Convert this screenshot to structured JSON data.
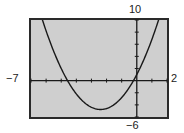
{
  "chart_data": {
    "type": "line",
    "title": "",
    "xlabel": "",
    "ylabel": "",
    "xlim": [
      -7,
      2
    ],
    "ylim": [
      -6,
      10
    ],
    "x_tick_step": 1,
    "y_tick_step": 2,
    "grid": false,
    "legend": null,
    "window_labels": {
      "xmin": "−7",
      "xmax": "2",
      "ymin": "−6",
      "ymax": "10"
    },
    "series": [
      {
        "name": "parabola",
        "equation_estimate": "y = x^2 + 4.8x + 1",
        "vertex": [
          -2.4,
          -4.76
        ],
        "x_intercepts": [
          -4.57,
          -0.23
        ],
        "x": [
          -6.3,
          -6,
          -5,
          -4.57,
          -4,
          -3,
          -2.4,
          -2,
          -1,
          -0.23,
          0,
          1,
          1.5
        ],
        "y": [
          10.5,
          8.2,
          2.0,
          0,
          -2.2,
          -4.4,
          -4.76,
          -4.6,
          -2.8,
          0,
          1.0,
          6.8,
          10.45
        ]
      }
    ],
    "colors": {
      "background": "#cfcfcf",
      "frame": "#2a2a2a",
      "curve": "#1a1a1a",
      "axes": "#1a1a1a"
    }
  }
}
